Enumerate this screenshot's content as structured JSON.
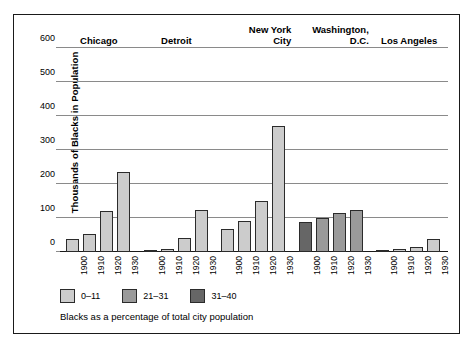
{
  "chart_data": {
    "type": "bar",
    "title": "",
    "subtitle": "",
    "xlabel": "",
    "ylabel": "Thousands of Blacks in Population",
    "ylim": [
      0,
      600
    ],
    "yticks": [
      0,
      100,
      200,
      300,
      400,
      500,
      600
    ],
    "ytick_labels": [
      "0",
      "100",
      "200",
      "300",
      "400",
      "500",
      "600"
    ],
    "grid": true,
    "legend_position": "below-plot",
    "categories": [
      "1900",
      "1910",
      "1920",
      "1930"
    ],
    "groups": [
      {
        "city": "Chicago",
        "values": [
          38,
          52,
          120,
          234
        ],
        "classes": [
          0,
          0,
          0,
          0
        ]
      },
      {
        "city": "Detroit",
        "values": [
          4,
          8,
          41,
          125
        ],
        "classes": [
          0,
          0,
          0,
          0
        ]
      },
      {
        "city": "New York\nCity",
        "values": [
          68,
          92,
          150,
          370
        ],
        "classes": [
          0,
          0,
          0,
          0
        ]
      },
      {
        "city": "Washington,\nD.C.",
        "values": [
          87,
          100,
          115,
          125
        ],
        "classes": [
          2,
          1,
          1,
          1
        ]
      },
      {
        "city": "Los Angeles",
        "values": [
          2,
          8,
          16,
          39
        ],
        "classes": [
          0,
          0,
          0,
          0
        ]
      }
    ],
    "legend": [
      {
        "label": "0–11",
        "color": "#cccccc"
      },
      {
        "label": "21–31",
        "color": "#9a9a9a"
      },
      {
        "label": "31–40",
        "color": "#666666"
      }
    ],
    "annotation": "Blacks as a percentage of total city population"
  }
}
